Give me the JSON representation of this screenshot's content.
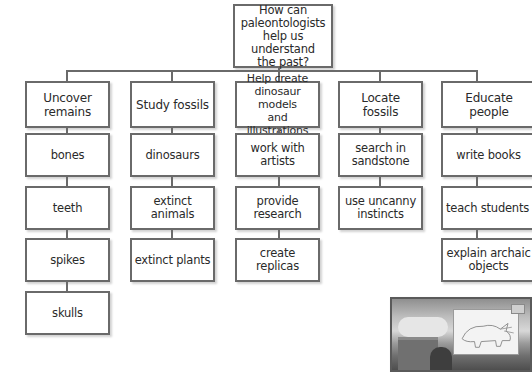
{
  "diagram": {
    "type": "tree / concept web",
    "root": {
      "label": "How can\npaleontologists\nhelp us understand\nthe past?"
    },
    "columns": [
      {
        "heading": "Uncover remains",
        "items": [
          "bones",
          "teeth",
          "spikes",
          "skulls"
        ]
      },
      {
        "heading": "Study fossils",
        "items": [
          "dinosaurs",
          "extinct\nanimals",
          "extinct plants"
        ]
      },
      {
        "heading": "Help create\ndinosaur models\nand illustrations",
        "items": [
          "work with\nartists",
          "provide\nresearch",
          "create\nreplicas"
        ]
      },
      {
        "heading": "Locate fossils",
        "items": [
          "search in\nsandstone",
          "use uncanny\ninstincts"
        ]
      },
      {
        "heading": "Educate people",
        "items": [
          "write books",
          "teach students",
          "explain archaic\nobjects"
        ]
      }
    ]
  },
  "illustration": {
    "description": "Sepia photo of a person at a drafting table drawing a triceratops sketch",
    "icon": "photo-illustration"
  },
  "colors": {
    "border": "#6a6a6a",
    "text": "#2a2a2a",
    "background": "#ffffff"
  }
}
